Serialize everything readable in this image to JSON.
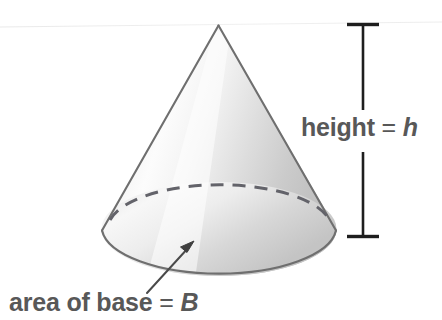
{
  "figure": {
    "type": "geometry-diagram",
    "width": 442,
    "height": 320,
    "background_color": "#ffffff"
  },
  "labels": {
    "height": {
      "prefix": "height",
      "equals": "=",
      "variable": "h",
      "full_text": "height = h",
      "color": "#585858"
    },
    "base": {
      "prefix": "area of base",
      "equals": "=",
      "variable": "B",
      "full_text": "area of base = B",
      "color": "#585858"
    }
  },
  "shape": {
    "name": "cone",
    "apex": {
      "x": 218,
      "y": 25
    },
    "base_center": {
      "x": 219,
      "y": 232
    },
    "base_radius_x": 117,
    "base_radius_y": 46,
    "outline_color": "#6f6f6f",
    "fill_light": "#fbfbfb",
    "fill_mid": "#e2e2e2",
    "fill_dark": "#c4c4c4",
    "hidden_edge_style": "dashed"
  },
  "annotations": {
    "height_dimension": {
      "name": "height-dimension-line",
      "x": 363,
      "top_y": 24,
      "bottom_y": 236,
      "cap_half_width": 16,
      "color": "#1e1e1e",
      "gap_top": 110,
      "gap_bottom": 150
    },
    "base_leader": {
      "name": "base-leader-arrow",
      "from": {
        "x": 148,
        "y": 292
      },
      "to": {
        "x": 194,
        "y": 242
      },
      "color": "#4a4a4a"
    }
  }
}
